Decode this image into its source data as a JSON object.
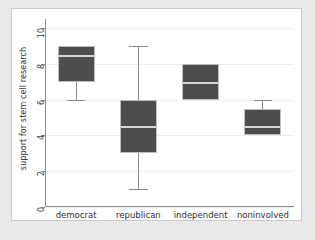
{
  "chart_data": {
    "type": "box",
    "title": "",
    "subtitle": "",
    "xlabel": "",
    "ylabel": "support for stem cell research",
    "categories": [
      "democrat",
      "republican",
      "independent",
      "noninvolved"
    ],
    "ylim": [
      0,
      10.5
    ],
    "yticks": [
      0,
      2,
      4,
      6,
      8,
      10
    ],
    "ytick_labels": [
      "0",
      "2",
      "4",
      "6",
      "8",
      "10"
    ],
    "grid": true,
    "grid_axis": "y",
    "legend": false,
    "legend_position": "none",
    "box_fill_color": "#4d4d4d",
    "median_color": "#d6d6d6",
    "whisker_color": "#8a8a8a",
    "plot_background": "#ffffff",
    "figure_background": "#e9e9e9",
    "boxes": [
      {
        "category": "democrat",
        "lower_whisker": 6,
        "q1": 7,
        "median": 8.5,
        "q3": 9,
        "upper_whisker": 9
      },
      {
        "category": "republican",
        "lower_whisker": 1,
        "q1": 3,
        "median": 4.5,
        "q3": 6,
        "upper_whisker": 9
      },
      {
        "category": "independent",
        "lower_whisker": 6,
        "q1": 6,
        "median": 7,
        "q3": 8,
        "upper_whisker": 8
      },
      {
        "category": "noninvolved",
        "lower_whisker": 4,
        "q1": 4,
        "median": 4.5,
        "q3": 5.5,
        "upper_whisker": 6
      }
    ]
  }
}
